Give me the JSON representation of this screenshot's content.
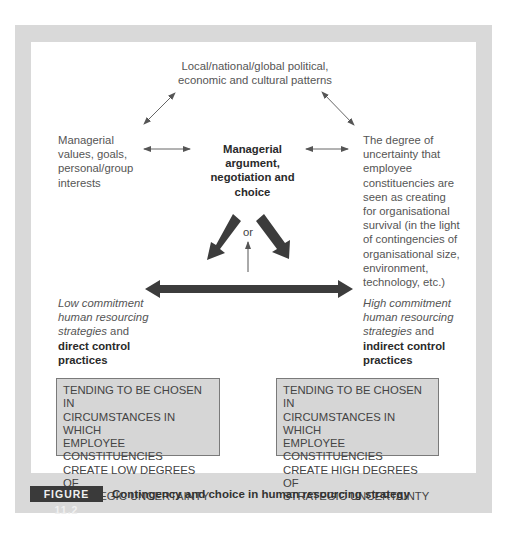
{
  "diagram": {
    "top_node": {
      "lines": [
        "Local/national/global political,",
        "economic and cultural patterns"
      ]
    },
    "left_node": {
      "lines": [
        "Managerial",
        "values, goals,",
        "personal/group",
        "interests"
      ]
    },
    "center_node": {
      "lines": [
        "Managerial",
        "argument,",
        "negotiation and",
        "choice"
      ]
    },
    "right_node": {
      "lines": [
        "The degree of",
        "uncertainty that",
        "employee",
        "constituencies are",
        "seen as creating",
        "for organisational",
        "survival (in the light",
        "of contingencies of",
        "organisational size,",
        "environment,",
        "technology, etc.)"
      ]
    },
    "or_label": "or",
    "left_outcome": {
      "italic_lines": [
        "Low commitment",
        "human resourcing"
      ],
      "italic_tail": "strategies",
      "plain_tail": " and",
      "bold_lines": [
        "direct control",
        "practices"
      ]
    },
    "right_outcome": {
      "italic_lines": [
        "High commitment",
        "human resourcing"
      ],
      "italic_tail": "strategies",
      "plain_tail": " and",
      "bold_lines": [
        "indirect control",
        "practices"
      ]
    },
    "left_box": {
      "lines": [
        "TENDING TO BE CHOSEN IN",
        "CIRCUMSTANCES IN WHICH",
        "EMPLOYEE CONSTITUENCIES",
        "CREATE LOW DEGREES OF",
        "STRATEGIC UNCERTAINTY"
      ]
    },
    "right_box": {
      "lines": [
        "TENDING TO BE CHOSEN IN",
        "CIRCUMSTANCES IN WHICH",
        "EMPLOYEE CONSTITUENCIES",
        "CREATE HIGH DEGREES OF",
        "STRATEGIC UNCERTAINTY"
      ]
    }
  },
  "caption": {
    "label": "FIGURE 11.2",
    "text": "Contingency and choice in human resourcing strategy"
  },
  "colors": {
    "frame": "#d9d9d9",
    "box_fill": "#d6d6d6",
    "arrow": "#3c3c3c",
    "label_bg": "#3a3a3a"
  }
}
